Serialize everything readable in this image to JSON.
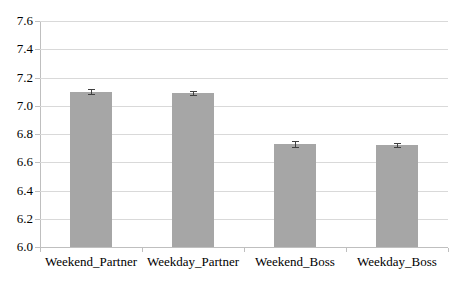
{
  "chart_data": {
    "type": "bar",
    "categories": [
      "Weekend_Partner",
      "Weekday_Partner",
      "Weekend_Boss",
      "Weekday_Boss"
    ],
    "values": [
      7.1,
      7.09,
      6.73,
      6.72
    ],
    "errors": [
      0.02,
      0.015,
      0.02,
      0.015
    ],
    "title": "",
    "xlabel": "",
    "ylabel": "",
    "ylim": [
      6.0,
      7.6
    ],
    "ytick_step": 0.2,
    "ytick_labels": [
      "6.0",
      "6.2",
      "6.4",
      "6.6",
      "6.8",
      "7.0",
      "7.2",
      "7.4",
      "7.6"
    ],
    "grid": true,
    "legend_position": "none",
    "colors": {
      "bar_fill": "#a6a6a6",
      "gridline": "#d9d9d9",
      "axis": "#bfbfbf",
      "error_bar": "#404040",
      "text": "#000000",
      "background": "#ffffff"
    }
  }
}
